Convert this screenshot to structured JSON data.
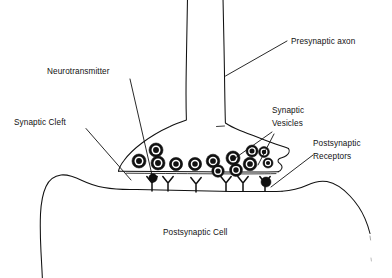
{
  "diagram": {
    "background_color": "#ffffff",
    "ink_color": "#111111",
    "labels": {
      "presynaptic_axon": "Presynaptic axon",
      "neurotransmitter": "Neurotransmitter",
      "synaptic_cleft": "Synaptic Cleft",
      "synaptic_vesicles_line1": "Synaptic",
      "synaptic_vesicles_line2": "Vesicles",
      "postsynaptic_receptors_line1": "Postsynaptic",
      "postsynaptic_receptors_line2": "Receptors",
      "postsynaptic_cell": "Postsynaptic Cell"
    },
    "parts": [
      {
        "name": "presynaptic-axon",
        "label": "Presynaptic axon"
      },
      {
        "name": "neurotransmitter",
        "label": "Neurotransmitter"
      },
      {
        "name": "synaptic-cleft",
        "label": "Synaptic Cleft"
      },
      {
        "name": "synaptic-vesicles",
        "label": "Synaptic Vesicles"
      },
      {
        "name": "postsynaptic-receptors",
        "label": "Postsynaptic Receptors"
      },
      {
        "name": "postsynaptic-cell",
        "label": "Postsynaptic Cell"
      }
    ],
    "counts": {
      "synaptic_vesicles": 13,
      "postsynaptic_receptors": 6,
      "free_neurotransmitter_dots": 2
    },
    "vesicles": [
      {
        "cx": 139,
        "cy": 161,
        "r": 7.0
      },
      {
        "cx": 156,
        "cy": 150,
        "r": 7.0
      },
      {
        "cx": 158,
        "cy": 163,
        "r": 7.0
      },
      {
        "cx": 176,
        "cy": 164,
        "r": 6.6
      },
      {
        "cx": 195,
        "cy": 164,
        "r": 6.6
      },
      {
        "cx": 213,
        "cy": 161,
        "r": 6.8
      },
      {
        "cx": 218,
        "cy": 171,
        "r": 6.2
      },
      {
        "cx": 233,
        "cy": 158,
        "r": 7.0
      },
      {
        "cx": 236,
        "cy": 170,
        "r": 6.4
      },
      {
        "cx": 250,
        "cy": 164,
        "r": 6.8
      },
      {
        "cx": 252,
        "cy": 151,
        "r": 6.0
      },
      {
        "cx": 264,
        "cy": 152,
        "r": 5.4
      },
      {
        "cx": 268,
        "cy": 163,
        "r": 5.0
      }
    ],
    "receptors": [
      {
        "x": 152,
        "y": 189
      },
      {
        "x": 168,
        "y": 189
      },
      {
        "x": 196,
        "y": 190
      },
      {
        "x": 226,
        "y": 189
      },
      {
        "x": 243,
        "y": 189
      },
      {
        "x": 265,
        "y": 189
      }
    ],
    "free_dots": [
      {
        "cx": 153,
        "cy": 178,
        "r": 4.2
      },
      {
        "cx": 266,
        "cy": 182,
        "r": 5.0
      }
    ]
  }
}
